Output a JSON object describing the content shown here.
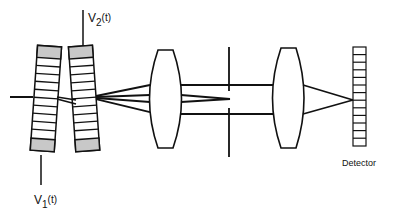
{
  "diagram": {
    "type": "optical-setup",
    "labels": {
      "v2": {
        "main": "V",
        "sub": "2",
        "arg": "(t)"
      },
      "v1": {
        "main": "V",
        "sub": "1",
        "arg": "(t)"
      },
      "detector": "Detector"
    },
    "components": [
      {
        "id": "modulator-1",
        "kind": "striped-modulator",
        "voltage": "V1(t)"
      },
      {
        "id": "modulator-2",
        "kind": "striped-modulator",
        "voltage": "V2(t)"
      },
      {
        "id": "lens-1",
        "kind": "convex-lens"
      },
      {
        "id": "aperture",
        "kind": "slit-aperture"
      },
      {
        "id": "lens-2",
        "kind": "convex-lens"
      },
      {
        "id": "detector",
        "kind": "detector-array",
        "cells": 13
      }
    ],
    "colors": {
      "ink": "#111111",
      "shade": "#c8c8c8",
      "background": "#ffffff"
    }
  }
}
